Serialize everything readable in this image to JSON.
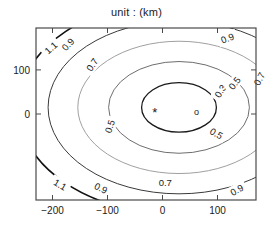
{
  "chart_data": {
    "type": "contour",
    "title": "unit : (km)",
    "xlabel": "",
    "ylabel": "",
    "xlim": [
      -230,
      170
    ],
    "ylim": [
      -195,
      195
    ],
    "xticks": [
      -200,
      -100,
      0,
      100
    ],
    "xtick_labels": [
      "−200",
      "−100",
      "0",
      "100"
    ],
    "yticks": [
      100,
      0
    ],
    "ytick_labels": [
      "100",
      "0"
    ],
    "grid": false,
    "legend": "none",
    "levels": [
      0.3,
      0.5,
      0.7,
      0.9,
      1.1
    ],
    "level_labels": [
      "0.3",
      "0.5",
      "0.7",
      "0.9",
      "1.1"
    ],
    "center": [
      30,
      15
    ],
    "contours": [
      {
        "level": 0.3,
        "label": "0.3",
        "color": "#1a1a1a",
        "width": 1.3,
        "cx": 30,
        "cy": 15,
        "rx": 68,
        "ry": 56,
        "labels": [
          {
            "text": "0.3",
            "x": 105,
            "y": 52,
            "rotate": -58
          },
          {
            "text": "0.5",
            "x": 98,
            "y": -44,
            "rotate": 30
          }
        ]
      },
      {
        "level": 0.5,
        "label": "0.5",
        "color": "#6e6e6e",
        "width": 1.0,
        "cx": 30,
        "cy": 15,
        "rx": 128,
        "ry": 104,
        "labels": [
          {
            "text": "0.5",
            "x": -96,
            "y": -28,
            "rotate": -72
          },
          {
            "text": "0.5",
            "x": 131,
            "y": 70,
            "rotate": -52
          }
        ]
      },
      {
        "level": 0.7,
        "label": "0.7",
        "color": "#a0a0a0",
        "width": 1.0,
        "cx": 30,
        "cy": 15,
        "rx": 184,
        "ry": 150,
        "labels": [
          {
            "text": "0.7",
            "x": -128,
            "y": 112,
            "rotate": -55
          },
          {
            "text": "0.7",
            "x": 176,
            "y": 80,
            "rotate": -62
          },
          {
            "text": "0.7",
            "x": 5,
            "y": -155,
            "rotate": 0
          }
        ]
      },
      {
        "level": 0.9,
        "label": "0.9",
        "color": "#3a3a3a",
        "width": 1.0,
        "cx": 30,
        "cy": 15,
        "rx": 238,
        "ry": 196,
        "labels": [
          {
            "text": "0.9",
            "x": -172,
            "y": 158,
            "rotate": -48
          },
          {
            "text": "0.9",
            "x": 118,
            "y": 172,
            "rotate": -22
          },
          {
            "text": "0.9",
            "x": -112,
            "y": -168,
            "rotate": 27
          },
          {
            "text": "0.9",
            "x": 135,
            "y": -172,
            "rotate": -30
          }
        ]
      },
      {
        "level": 1.1,
        "label": "1.1",
        "color": "#111111",
        "width": 1.6,
        "cx": 30,
        "cy": 15,
        "rx": 292,
        "ry": 243,
        "labels": [
          {
            "text": "1.1",
            "x": -203,
            "y": 150,
            "rotate": -42
          },
          {
            "text": "1.1",
            "x": -186,
            "y": -160,
            "rotate": 30
          }
        ]
      }
    ],
    "markers": [
      {
        "name": "asterisk-marker",
        "symbol": "*",
        "x": -14,
        "y": 4,
        "color": "#1a1a1a"
      },
      {
        "name": "circle-marker",
        "symbol": "o",
        "x": 62,
        "y": 4,
        "color": "#1a1a1a"
      }
    ]
  }
}
